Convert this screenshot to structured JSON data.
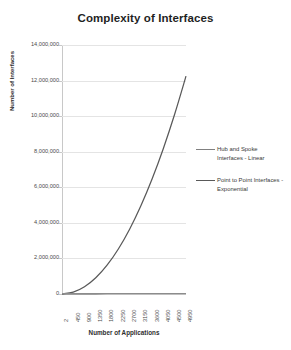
{
  "chart_data": {
    "type": "line",
    "title": "Complexity of Interfaces",
    "xlabel": "Number of Applications",
    "ylabel": "Number of Interfaces",
    "x": [
      2,
      450,
      900,
      1350,
      1800,
      2250,
      2700,
      3150,
      3600,
      4050,
      4500,
      4950
    ],
    "xtick_labels": [
      "2",
      "450",
      "900",
      "1350",
      "1800",
      "2250",
      "2700",
      "3150",
      "3600",
      "4050",
      "4500",
      "4950"
    ],
    "ytick_labels": [
      "14,000,000",
      "12,000,000",
      "10,000,000",
      "8,000,000",
      "6,000,000",
      "4,000,000",
      "2,000,000",
      "0"
    ],
    "ytick_values": [
      14000000,
      12000000,
      10000000,
      8000000,
      6000000,
      4000000,
      2000000,
      0
    ],
    "ylim": [
      0,
      14000000
    ],
    "xlim": [
      2,
      4950
    ],
    "grid": true,
    "legend_position": "right",
    "series": [
      {
        "name": "Hub and Spoke Interfaces - Linear",
        "color": "#808080",
        "values": [
          2,
          450,
          900,
          1350,
          1800,
          2250,
          2700,
          3150,
          3600,
          4050,
          4500,
          4950
        ]
      },
      {
        "name": "Point to Point Interfaces - Exponential",
        "color": "#595959",
        "values": [
          1,
          101025,
          404550,
          910575,
          1619100,
          2530125,
          3643650,
          4959675,
          6478200,
          8199225,
          10122750,
          12248775
        ]
      }
    ]
  },
  "legend": {
    "entries": [
      {
        "label": "Hub and Spoke Interfaces - Linear"
      },
      {
        "label": "Point to Point Interfaces - Exponential"
      }
    ]
  },
  "colors": {
    "gridline": "#e4e4e4",
    "axis": "#8c8c8c",
    "linear_series": "#808080",
    "exponential_series": "#595959",
    "background": "#ffffff",
    "title_text": "#1f1f1f"
  }
}
